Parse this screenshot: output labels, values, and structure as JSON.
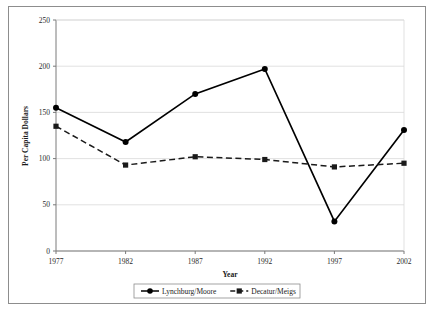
{
  "chart_data": {
    "type": "line",
    "title": "",
    "xlabel": "Year",
    "ylabel": "Per Capita Dollars",
    "categories": [
      "1977",
      "1982",
      "1987",
      "1992",
      "1997",
      "2002"
    ],
    "x": [
      1977,
      1982,
      1987,
      1992,
      1997,
      2002
    ],
    "xlim": [
      1977,
      2002
    ],
    "ylim": [
      0,
      250
    ],
    "yticks": [
      0,
      50,
      100,
      150,
      200,
      250
    ],
    "ytick_labels": [
      "0",
      "50",
      "100",
      "150",
      "200",
      "250"
    ],
    "grid": "horizontal",
    "legend_position": "bottom-center",
    "series": [
      {
        "name": "Lynchburg/Moore",
        "values": [
          155,
          118,
          170,
          197,
          32,
          131
        ],
        "marker": "circle",
        "line_style": "solid",
        "color": "#000000"
      },
      {
        "name": "Decatur/Meigs",
        "values": [
          135,
          93,
          102,
          99,
          91,
          95
        ],
        "marker": "square",
        "line_style": "dashed",
        "color": "#1a1a1a"
      }
    ]
  },
  "axes": {
    "y_title": "Per Capita Dollars",
    "x_title": "Year"
  },
  "legend": {
    "entries": [
      {
        "label": "Lynchburg/Moore",
        "marker": "circle-marker",
        "line_style": "solid"
      },
      {
        "label": "Decatur/Meigs",
        "marker": "square-marker",
        "line_style": "dashed"
      }
    ]
  },
  "colors": {
    "frame": "#8d8d8d",
    "grid": "#d9d9d9",
    "axis": "#7a7a7a",
    "series_1": "#000000",
    "series_2": "#1a1a1a",
    "background": "#ffffff"
  }
}
